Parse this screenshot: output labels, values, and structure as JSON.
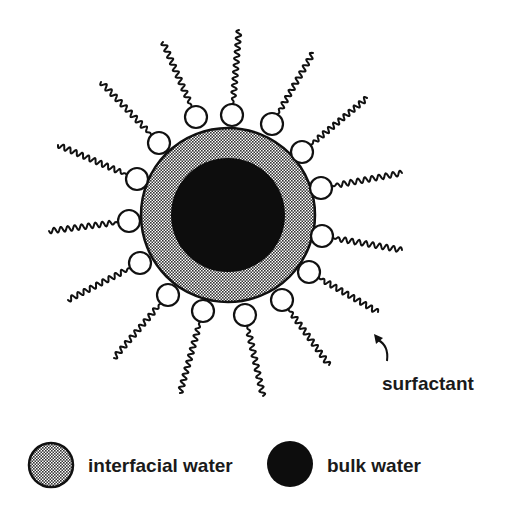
{
  "diagram": {
    "colors": {
      "background": "#ffffff",
      "stroke": "#111111",
      "bulk_water": "#0d0d0d",
      "interfacial_water_fill": "#9a9a9a",
      "head_fill": "#ffffff"
    },
    "micelle": {
      "center": [
        228,
        215
      ],
      "outer_radius": 87,
      "inner_radius": 57
    },
    "head_radius": 11,
    "surfactants": [
      {
        "head": [
          196,
          117
        ],
        "tail_end": [
          163,
          42
        ]
      },
      {
        "head": [
          232,
          115
        ],
        "tail_end": [
          239,
          30
        ]
      },
      {
        "head": [
          272,
          124
        ],
        "tail_end": [
          313,
          53
        ]
      },
      {
        "head": [
          302,
          152
        ],
        "tail_end": [
          367,
          98
        ]
      },
      {
        "head": [
          321,
          188
        ],
        "tail_end": [
          402,
          173
        ]
      },
      {
        "head": [
          322,
          236
        ],
        "tail_end": [
          402,
          250
        ]
      },
      {
        "head": [
          309,
          272
        ],
        "tail_end": [
          378,
          312
        ]
      },
      {
        "head": [
          282,
          300
        ],
        "tail_end": [
          329,
          365
        ]
      },
      {
        "head": [
          245,
          315
        ],
        "tail_end": [
          263,
          396
        ]
      },
      {
        "head": [
          203,
          311
        ],
        "tail_end": [
          180,
          393
        ]
      },
      {
        "head": [
          168,
          295
        ],
        "tail_end": [
          114,
          358
        ]
      },
      {
        "head": [
          140,
          263
        ],
        "tail_end": [
          68,
          300
        ]
      },
      {
        "head": [
          129,
          221
        ],
        "tail_end": [
          49,
          231
        ]
      },
      {
        "head": [
          137,
          179
        ],
        "tail_end": [
          58,
          145
        ]
      },
      {
        "head": [
          159,
          143
        ],
        "tail_end": [
          101,
          82
        ]
      }
    ],
    "annotation": {
      "label": "surfactant",
      "label_pos": [
        382,
        374
      ],
      "arrow_start": [
        387,
        361
      ],
      "arrow_tip": [
        374,
        334
      ]
    },
    "legend": [
      {
        "key": "interfacial",
        "label": "interfacial water",
        "swatch_center": [
          51,
          465
        ],
        "swatch_radius": 22,
        "label_pos": [
          88,
          456
        ]
      },
      {
        "key": "bulk",
        "label": "bulk water",
        "swatch_center": [
          290,
          464
        ],
        "swatch_radius": 23,
        "label_pos": [
          327,
          456
        ]
      }
    ]
  }
}
